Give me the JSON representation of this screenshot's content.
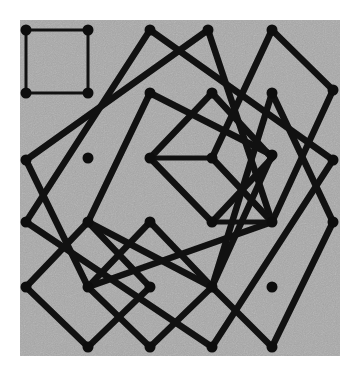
{
  "figure": {
    "kind": "geometric-diagram",
    "canvas": {
      "width": 362,
      "height": 375
    },
    "panel": {
      "name": "gray-plot-panel",
      "x": 20,
      "y": 20,
      "width": 320,
      "height": 336,
      "fill": "#a9a9a9",
      "noise": true
    },
    "colors": {
      "background": "#ffffff",
      "panel_fill": "#a9a9a9",
      "stroke": "#111111",
      "vertex_fill": "#0d0d0d"
    },
    "lattice": {
      "x_positions": [
        26,
        88,
        150,
        212,
        272,
        333
      ],
      "y_positions": [
        30,
        93,
        158,
        222,
        287,
        347
      ],
      "spacing": 61
    },
    "stroke_widths": {
      "thin": 3.0,
      "medium": 5.0,
      "thick": 6.5
    },
    "vertex_radius": 5.5,
    "squares": [
      {
        "name": "small-axis-aligned-square-top-left",
        "stroke_width": 3.0,
        "points": [
          [
            26,
            30
          ],
          [
            88,
            30
          ],
          [
            88,
            93
          ],
          [
            26,
            93
          ]
        ]
      },
      {
        "name": "large-tilted-square-outer",
        "stroke_width": 6.5,
        "points": [
          [
            150,
            30
          ],
          [
            333,
            160
          ],
          [
            212,
            347
          ],
          [
            26,
            222
          ]
        ]
      },
      {
        "name": "tall-tilted-square-left",
        "stroke_width": 6.5,
        "points": [
          [
            208,
            30
          ],
          [
            272,
            222
          ],
          [
            88,
            287
          ],
          [
            26,
            160
          ]
        ]
      },
      {
        "name": "tilted-square-upper-right",
        "stroke_width": 6.5,
        "points": [
          [
            272,
            30
          ],
          [
            333,
            90
          ],
          [
            272,
            222
          ],
          [
            212,
            158
          ]
        ]
      },
      {
        "name": "tilted-square-right-lower",
        "stroke_width": 6.5,
        "points": [
          [
            272,
            93
          ],
          [
            333,
            222
          ],
          [
            272,
            347
          ],
          [
            212,
            287
          ]
        ]
      },
      {
        "name": "mid-square-center",
        "stroke_width": 6.5,
        "points": [
          [
            150,
            93
          ],
          [
            272,
            155
          ],
          [
            212,
            287
          ],
          [
            88,
            222
          ]
        ]
      },
      {
        "name": "small-square-center-inner",
        "stroke_width": 5.0,
        "points": [
          [
            212,
            158
          ],
          [
            272,
            222
          ],
          [
            212,
            222
          ],
          [
            150,
            158
          ]
        ]
      },
      {
        "name": "small-tilted-square-bottom-left",
        "stroke_width": 6.5,
        "points": [
          [
            88,
            222
          ],
          [
            150,
            287
          ],
          [
            88,
            347
          ],
          [
            26,
            287
          ]
        ]
      },
      {
        "name": "small-tilted-square-bottom-mid",
        "stroke_width": 6.5,
        "points": [
          [
            150,
            222
          ],
          [
            212,
            287
          ],
          [
            150,
            347
          ],
          [
            88,
            287
          ]
        ]
      },
      {
        "name": "diagonal-square-upper-mid",
        "stroke_width": 6.5,
        "points": [
          [
            212,
            93
          ],
          [
            272,
            158
          ],
          [
            212,
            222
          ],
          [
            150,
            158
          ]
        ]
      }
    ],
    "vertices": [
      [
        26,
        30
      ],
      [
        88,
        30
      ],
      [
        150,
        30
      ],
      [
        208,
        30
      ],
      [
        272,
        30
      ],
      [
        333,
        90
      ],
      [
        26,
        93
      ],
      [
        88,
        93
      ],
      [
        150,
        93
      ],
      [
        212,
        93
      ],
      [
        272,
        93
      ],
      [
        26,
        160
      ],
      [
        88,
        158
      ],
      [
        150,
        158
      ],
      [
        212,
        158
      ],
      [
        272,
        155
      ],
      [
        333,
        160
      ],
      [
        88,
        222
      ],
      [
        150,
        222
      ],
      [
        212,
        222
      ],
      [
        272,
        222
      ],
      [
        333,
        222
      ],
      [
        26,
        222
      ],
      [
        26,
        287
      ],
      [
        88,
        287
      ],
      [
        150,
        287
      ],
      [
        212,
        287
      ],
      [
        272,
        287
      ],
      [
        88,
        347
      ],
      [
        150,
        347
      ],
      [
        212,
        347
      ],
      [
        272,
        347
      ]
    ]
  }
}
